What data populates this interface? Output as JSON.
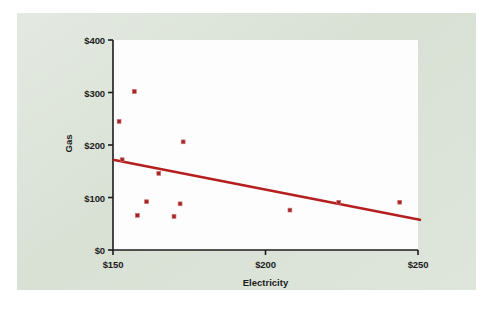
{
  "figure": {
    "panel_color": "#d8e0d4",
    "plot_background": "#fdfdfd",
    "accent_color": "#b51f1f",
    "marker_color": "#a52121",
    "axis_color": "#1c1c1c"
  },
  "chart_data": {
    "type": "scatter",
    "title": "",
    "subtitle": "",
    "xlabel": "Electricity",
    "ylabel": "Gas",
    "xlim": [
      150,
      250
    ],
    "ylim": [
      0,
      400
    ],
    "xticks": [
      150,
      200,
      250
    ],
    "xtick_labels": [
      "$150",
      "$200",
      "$250"
    ],
    "yticks": [
      0,
      100,
      200,
      300,
      400
    ],
    "ytick_labels": [
      "$0",
      "$100",
      "$200",
      "$300",
      "$400"
    ],
    "grid": false,
    "legend": null,
    "points": [
      {
        "x": 152,
        "y": 245
      },
      {
        "x": 153,
        "y": 172
      },
      {
        "x": 157,
        "y": 302
      },
      {
        "x": 158,
        "y": 66
      },
      {
        "x": 161,
        "y": 92
      },
      {
        "x": 165,
        "y": 146
      },
      {
        "x": 170,
        "y": 64
      },
      {
        "x": 172,
        "y": 88
      },
      {
        "x": 173,
        "y": 206
      },
      {
        "x": 208,
        "y": 76
      },
      {
        "x": 224,
        "y": 91
      },
      {
        "x": 244,
        "y": 91
      }
    ],
    "trendline": {
      "label": "linear fit",
      "x_start": 150,
      "y_start": 172,
      "x_end": 251,
      "y_end": 57,
      "color": "#b51f1f"
    }
  }
}
